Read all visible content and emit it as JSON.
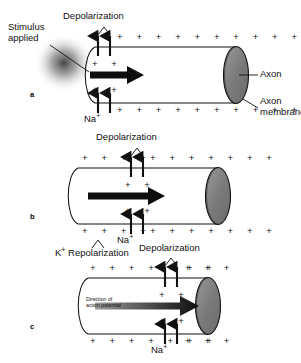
{
  "figure": {
    "background": "#ffffff",
    "ink": "#111111",
    "axon_fill": "#7d7d7d"
  },
  "labels": {
    "stimulus_line1": "Stimulus",
    "stimulus_line2": "applied",
    "depolarization": "Depolarization",
    "sodium_ion": "Na",
    "sodium_charge": "+",
    "potassium_ion": "K",
    "potassium_charge": "+",
    "repolarization": " Repolarization",
    "axon": "Axon",
    "axon_membrane_line1": "Axon",
    "axon_membrane_line2": "membrane",
    "direction_line1": "Direction of",
    "direction_line2": "action potential",
    "plus": "+"
  },
  "panels": [
    {
      "letter": "a",
      "name": "panel-a-stimulus-applied",
      "description": "Stimulus applied at left end; depolarization begins at the stimulated site",
      "depolarization_position": "left",
      "has_stimulus_blob": true,
      "arrow_style": "solid",
      "top_plus_left": 0,
      "top_plus_right": 11,
      "bottom_plus_left": 0,
      "bottom_plus_right": 11,
      "left_end": "open"
    },
    {
      "letter": "b",
      "name": "panel-b-impulse-midway",
      "description": "Depolarization zone has moved to the middle of the axon",
      "depolarization_position": "middle",
      "has_stimulus_blob": false,
      "arrow_style": "solid",
      "top_plus_left": 4,
      "top_plus_right": 7,
      "bottom_plus_left": 4,
      "bottom_plus_right": 7,
      "left_end": "closed"
    },
    {
      "letter": "c",
      "name": "panel-c-impulse-near-terminal",
      "description": "Depolarization zone near the axon terminal; potassium repolarization follows behind",
      "depolarization_position": "right",
      "has_stimulus_blob": false,
      "arrow_style": "gradient",
      "top_plus_left": 7,
      "top_plus_right": 3,
      "bottom_plus_left": 7,
      "bottom_plus_right": 3,
      "left_end": "closed"
    }
  ]
}
